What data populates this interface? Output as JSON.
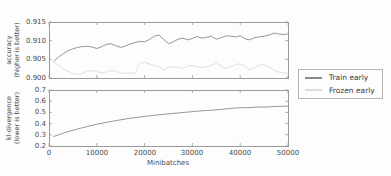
{
  "figure": {
    "top_chart": {
      "ylabel_line1": "accuracy",
      "ylabel_line2": "(higher is better)",
      "ytick_labels": [
        "0.915",
        "0.910",
        "0.905",
        "0.900"
      ]
    },
    "bottom_chart": {
      "ylabel_line1": "kl-divergence",
      "ylabel_line2": "(lower is better)",
      "ytick_labels": [
        "0.7",
        "0.6",
        "0.5",
        "0.4",
        "0.3",
        "0.2"
      ],
      "xtick_labels": [
        "0",
        "10000",
        "20000",
        "30000",
        "40000",
        "50000"
      ],
      "xlabel": "Minibatches"
    },
    "legend": {
      "entries": [
        {
          "label": "Train early",
          "color": "#8a8a8a"
        },
        {
          "label": "Frozen early",
          "color": "#dcdcdc"
        }
      ]
    },
    "colors": {
      "spine": "#9a9a9a",
      "train_line": "#8a8a8a",
      "frozen_line": "#dcdcdc",
      "kl_line": "#8a8a8a",
      "text": "#4a4a4a"
    }
  },
  "chart_data": [
    {
      "type": "line",
      "title": "",
      "xlabel": "",
      "ylabel": "accuracy (higher is better)",
      "xlim": [
        0,
        50000
      ],
      "ylim": [
        0.9,
        0.915
      ],
      "xticks": [
        0,
        10000,
        20000,
        30000,
        40000,
        50000
      ],
      "yticks": [
        0.9,
        0.905,
        0.91,
        0.915
      ],
      "grid": false,
      "legend_position": "right-of-axes",
      "x": [
        1000,
        2000,
        3000,
        4000,
        5000,
        6000,
        7000,
        8000,
        9000,
        10000,
        11000,
        12000,
        13000,
        14000,
        15000,
        16000,
        17000,
        18000,
        19000,
        20000,
        21000,
        22000,
        23000,
        24000,
        25000,
        26000,
        27000,
        28000,
        29000,
        30000,
        31000,
        32000,
        33000,
        34000,
        35000,
        36000,
        37000,
        38000,
        39000,
        40000,
        41000,
        42000,
        43000,
        44000,
        45000,
        46000,
        47000,
        48000,
        49000,
        50000
      ],
      "series": [
        {
          "name": "Train early",
          "color": "#8a8a8a",
          "values": [
            0.9045,
            0.9056,
            0.9065,
            0.9073,
            0.9078,
            0.9082,
            0.9084,
            0.9085,
            0.9083,
            0.9079,
            0.9084,
            0.909,
            0.9092,
            0.9086,
            0.9082,
            0.9086,
            0.9091,
            0.9095,
            0.9098,
            0.9097,
            0.9103,
            0.9112,
            0.9115,
            0.9103,
            0.9092,
            0.9097,
            0.9104,
            0.9107,
            0.9102,
            0.9106,
            0.9111,
            0.9107,
            0.9109,
            0.9112,
            0.9104,
            0.9108,
            0.9113,
            0.9112,
            0.911,
            0.9113,
            0.9105,
            0.9102,
            0.9108,
            0.911,
            0.9112,
            0.9115,
            0.912,
            0.9118,
            0.9116,
            0.9118
          ]
        },
        {
          "name": "Frozen early",
          "color": "#dcdcdc",
          "values": [
            0.9042,
            0.9035,
            0.9025,
            0.9018,
            0.9012,
            0.901,
            0.9012,
            0.9018,
            0.902,
            0.9017,
            0.9014,
            0.9016,
            0.902,
            0.9018,
            0.9014,
            0.9012,
            0.9014,
            0.9012,
            0.904,
            0.9042,
            0.9038,
            0.9034,
            0.903,
            0.9022,
            0.9028,
            0.903,
            0.9028,
            0.9026,
            0.9032,
            0.9034,
            0.903,
            0.9028,
            0.903,
            0.9034,
            0.904,
            0.9032,
            0.9026,
            0.903,
            0.9036,
            0.9038,
            0.9032,
            0.9022,
            0.9028,
            0.9034,
            0.9036,
            0.903,
            0.9022,
            0.9016,
            0.9014,
            0.9012
          ]
        }
      ]
    },
    {
      "type": "line",
      "title": "",
      "xlabel": "Minibatches",
      "ylabel": "kl-divergence (lower is better)",
      "xlim": [
        0,
        50000
      ],
      "ylim": [
        0.2,
        0.7
      ],
      "xticks": [
        0,
        10000,
        20000,
        30000,
        40000,
        50000
      ],
      "yticks": [
        0.2,
        0.3,
        0.4,
        0.5,
        0.6,
        0.7
      ],
      "grid": false,
      "x": [
        1000,
        2000,
        3000,
        4000,
        5000,
        6000,
        7000,
        8000,
        9000,
        10000,
        11000,
        12000,
        13000,
        14000,
        15000,
        16000,
        17000,
        18000,
        19000,
        20000,
        21000,
        22000,
        23000,
        24000,
        25000,
        26000,
        27000,
        28000,
        29000,
        30000,
        31000,
        32000,
        33000,
        34000,
        35000,
        36000,
        37000,
        38000,
        39000,
        40000,
        41000,
        42000,
        43000,
        44000,
        45000,
        46000,
        47000,
        48000,
        49000,
        50000
      ],
      "series": [
        {
          "name": "kl-divergence",
          "color": "#8a8a8a",
          "values": [
            0.285,
            0.3,
            0.315,
            0.328,
            0.34,
            0.352,
            0.363,
            0.374,
            0.384,
            0.394,
            0.403,
            0.411,
            0.419,
            0.427,
            0.434,
            0.441,
            0.448,
            0.454,
            0.459,
            0.464,
            0.469,
            0.474,
            0.479,
            0.483,
            0.487,
            0.491,
            0.495,
            0.499,
            0.503,
            0.507,
            0.511,
            0.514,
            0.517,
            0.52,
            0.523,
            0.527,
            0.531,
            0.535,
            0.539,
            0.541,
            0.542,
            0.543,
            0.546,
            0.548,
            0.547,
            0.549,
            0.552,
            0.554,
            0.555,
            0.557
          ]
        }
      ]
    }
  ]
}
